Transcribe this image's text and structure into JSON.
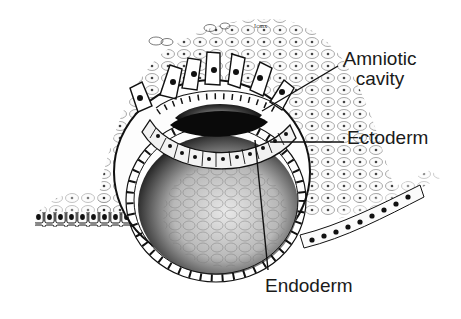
{
  "figure": {
    "scale_label": "Icmx",
    "labels": [
      {
        "id": "amniotic",
        "line1": "Amniotic",
        "line2": "cavity"
      },
      {
        "id": "ectoderm",
        "text": "Ectoderm"
      },
      {
        "id": "endoderm",
        "text": "Endoderm"
      }
    ],
    "colors": {
      "ink": "#111111",
      "label": "#1a1a1a",
      "background": "#ffffff",
      "cell_fill": "#f4f4f4",
      "stipple": "#2a2a2a"
    }
  }
}
